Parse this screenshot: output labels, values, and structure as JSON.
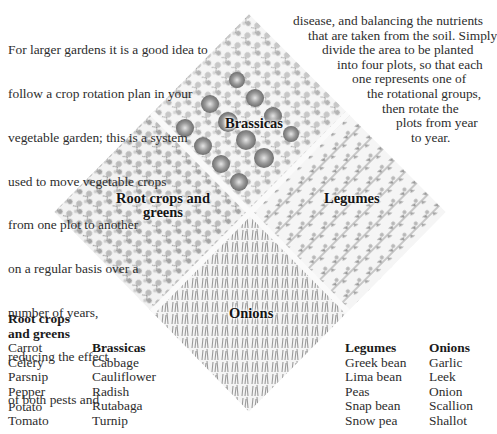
{
  "intro": {
    "left_lines": [
      "For larger gardens it is a good idea to",
      "follow a crop rotation plan in your",
      "vegetable garden; this is a system",
      "used to move vegetable crops",
      "from one plot to another",
      "on a regular basis over a",
      "number of years,",
      "reducing the effect",
      "of both pests and"
    ],
    "right_lines": [
      "disease, and balancing the nutrients",
      "that are taken from the soil. Simply",
      "divide the area to be planted",
      "into four plots, so that each",
      "one represents one of",
      "the rotational groups,",
      "then rotate the",
      "plots from year",
      "to year."
    ]
  },
  "diagram": {
    "plots": {
      "brassicas": "Brassicas",
      "root_crops": "Root crops and greens",
      "legumes": "Legumes",
      "onions": "Onions"
    }
  },
  "lists": {
    "root_crops": {
      "heading_line1": "Root crops",
      "heading_line2": "and greens",
      "items": [
        "Carrot",
        "Celery",
        "Parsnip",
        "Pepper",
        "Potato",
        "Tomato"
      ]
    },
    "brassicas": {
      "heading": "Brassicas",
      "items": [
        "Cabbage",
        "Cauliflower",
        "Radish",
        "Rutabaga",
        "Turnip"
      ]
    },
    "legumes": {
      "heading": "Legumes",
      "items": [
        "Greek bean",
        "Lima bean",
        "Peas",
        "Snap bean",
        "Snow pea"
      ]
    },
    "onions": {
      "heading": "Onions",
      "items": [
        "Garlic",
        "Leek",
        "Onion",
        "Scallion",
        "Shallot"
      ]
    }
  }
}
